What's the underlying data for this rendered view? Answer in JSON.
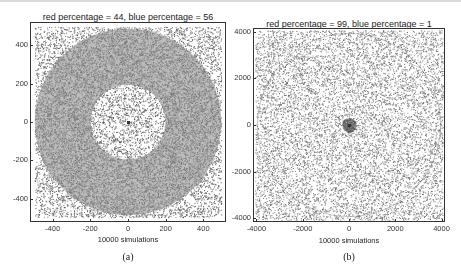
{
  "figure": {
    "captions": [
      "(a)",
      "(b)"
    ]
  },
  "chart_data": [
    {
      "type": "scatter",
      "title": "red percentage = 44, blue percentage = 56",
      "xlabel": "10000 simulations",
      "ylabel": "",
      "xlim": [
        -520,
        520
      ],
      "ylim": [
        -520,
        520
      ],
      "xticks": [
        -400,
        -200,
        0,
        200,
        400
      ],
      "yticks": [
        -400,
        -200,
        0,
        200,
        400
      ],
      "n_points": 10000,
      "description": "Uniform square of points; annulus (inner radius ~200, outer radius ~500) densely shaded gray; sparse interior disk and corners",
      "regions": [
        {
          "name": "inner-disk",
          "r_min": 0,
          "r_max": 200,
          "shade": "sparse"
        },
        {
          "name": "annulus",
          "r_min": 200,
          "r_max": 500,
          "shade": "dense"
        },
        {
          "name": "outer-corners",
          "r_min": 500,
          "r_max": 740,
          "shade": "sparse"
        }
      ],
      "caption": "(a)"
    },
    {
      "type": "scatter",
      "title": "red percentage = 99, blue percentage = 1",
      "xlabel": "10000 simulations",
      "ylabel": "",
      "xlim": [
        -4150,
        4150
      ],
      "ylim": [
        -4150,
        4150
      ],
      "xticks": [
        -4000,
        -2000,
        0,
        2000,
        4000
      ],
      "yticks": [
        -4000,
        -2000,
        0,
        2000,
        4000
      ],
      "n_points": 10000,
      "description": "Uniform square of sparse points; faint circle outline at radius ~4000; small dense cluster near origin (radius ~300)",
      "regions": [
        {
          "name": "center-cluster",
          "r_min": 0,
          "r_max": 300,
          "shade": "dense"
        },
        {
          "name": "field",
          "r_min": 300,
          "r_max": 5900,
          "shade": "sparse"
        },
        {
          "name": "circle-outline",
          "radius": 4000
        }
      ],
      "caption": "(b)"
    }
  ]
}
